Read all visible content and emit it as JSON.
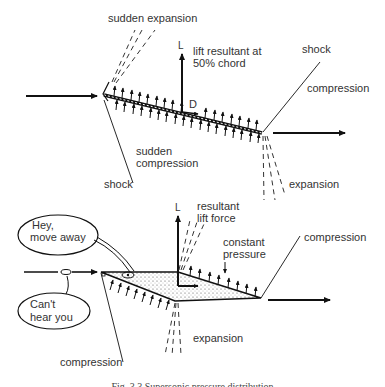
{
  "figure": {
    "caption": "Fig. 3.3  Supersonic pressure distribution",
    "top_diagram": {
      "labels": {
        "sudden_expansion": "sudden expansion",
        "lift_symbol": "L",
        "lift_resultant": "lift resultant at",
        "lift_resultant_2": "50% chord",
        "drag_symbol": "D",
        "shock_right": "shock",
        "compression_right": "compression",
        "sudden_compression_1": "sudden",
        "sudden_compression_2": "compression",
        "shock_left": "shock",
        "expansion": "expansion"
      }
    },
    "bottom_diagram": {
      "labels": {
        "lift_symbol": "L",
        "resultant_lift_1": "resultant",
        "resultant_lift_2": "lift force",
        "constant_pressure_1": "constant",
        "constant_pressure_2": "pressure",
        "compression_right": "compression",
        "expansion": "expansion",
        "compression_bottom": "compression",
        "bubble_top_1": "Hey,",
        "bubble_top_2": "move away",
        "bubble_bottom_1": "Can't",
        "bubble_bottom_2": "hear you"
      }
    }
  }
}
